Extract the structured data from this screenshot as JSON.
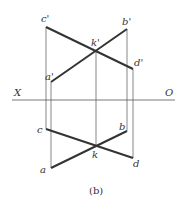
{
  "caption": "(b)",
  "axis": {
    "left_label": "X",
    "right_label": "O"
  },
  "labels": {
    "c_prime": "c'",
    "b_prime": "b'",
    "k_prime": "k'",
    "d_prime": "d'",
    "a_prime": "a'",
    "c": "c",
    "b": "b",
    "k": "k",
    "d": "d",
    "a": "a"
  },
  "colors": {
    "line": "#333333",
    "thin": "#555555"
  }
}
